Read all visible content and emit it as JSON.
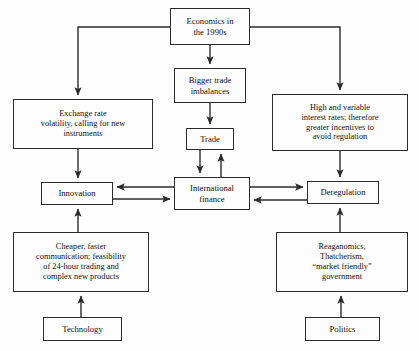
{
  "diagram": {
    "title_node": "economics-in-the-1990s",
    "nodes": [
      {
        "key": "economics",
        "name": "node-economics-in-the-1990s",
        "label": "Economics in\nthe 1990s",
        "x": 170,
        "y": 8,
        "w": 80,
        "h": 37
      },
      {
        "key": "bigger_trade",
        "name": "node-bigger-trade-imbalances",
        "label": "Bigger trade\nimbalances",
        "x": 174,
        "y": 68,
        "w": 72,
        "h": 35
      },
      {
        "key": "trade",
        "name": "node-trade",
        "label": "Trade",
        "x": 186,
        "y": 128,
        "w": 48,
        "h": 22
      },
      {
        "key": "exchange_rate",
        "name": "node-exchange-rate-volatility",
        "label": "Exchange rate\nvolatility, calling for new\ninstruments",
        "x": 13,
        "y": 99,
        "w": 140,
        "h": 50
      },
      {
        "key": "high_rates",
        "name": "node-high-and-variable-interest-rates",
        "label": "High and variable\ninterest rates; therefore\ngreater incentives to\navoid regulation",
        "x": 272,
        "y": 94,
        "w": 136,
        "h": 57
      },
      {
        "key": "innovation",
        "name": "node-innovation",
        "label": "Innovation",
        "x": 41,
        "y": 182,
        "w": 72,
        "h": 23
      },
      {
        "key": "intl_finance",
        "name": "node-international-finance",
        "label": "International\nfinance",
        "x": 174,
        "y": 177,
        "w": 76,
        "h": 33
      },
      {
        "key": "deregulation",
        "name": "node-deregulation",
        "label": "Deregulation",
        "x": 307,
        "y": 181,
        "w": 72,
        "h": 23
      },
      {
        "key": "cheaper_faster",
        "name": "node-cheaper-faster-communication",
        "label": "Cheaper, faster\ncommunication; feasibility\nof 24-hour trading and\ncomplex new products",
        "x": 13,
        "y": 232,
        "w": 136,
        "h": 60
      },
      {
        "key": "reaganomics",
        "name": "node-reaganomics-thatcherism",
        "label": "Reaganomics,\nThatcherism,\n“market friendly”\ngovernment",
        "x": 276,
        "y": 232,
        "w": 132,
        "h": 60
      },
      {
        "key": "technology",
        "name": "node-technology",
        "label": "Technology",
        "x": 43,
        "y": 317,
        "w": 79,
        "h": 24
      },
      {
        "key": "politics",
        "name": "node-politics",
        "label": "Politics",
        "x": 305,
        "y": 317,
        "w": 75,
        "h": 24
      }
    ],
    "edges": [
      {
        "name": "edge-economics-to-exchange-rate",
        "from": "economics",
        "to": "exchange_rate",
        "kind": "elbow-left",
        "points": "210,27 78,27 78,95",
        "arrow_end": true
      },
      {
        "name": "edge-economics-to-high-rates",
        "from": "economics",
        "to": "high_rates",
        "kind": "elbow-right",
        "points": "210,27 340,27 340,90",
        "arrow_end": true
      },
      {
        "name": "edge-economics-to-bigger-trade",
        "from": "economics",
        "to": "bigger_trade",
        "kind": "straight-down",
        "points": "210,45 210,64",
        "arrow_end": true
      },
      {
        "name": "edge-bigger-trade-to-trade",
        "from": "bigger_trade",
        "to": "trade",
        "kind": "straight-down",
        "points": "210,103 210,124",
        "arrow_end": true
      },
      {
        "name": "edge-trade-to-international-finance",
        "from": "trade",
        "to": "intl_finance",
        "kind": "straight-down",
        "points": "200,150 200,173",
        "arrow_end": true
      },
      {
        "name": "edge-international-finance-to-trade",
        "from": "intl_finance",
        "to": "trade",
        "kind": "straight-up",
        "points": "221,177 221,154",
        "arrow_end": true
      },
      {
        "name": "edge-exchange-rate-to-innovation",
        "from": "exchange_rate",
        "to": "innovation",
        "kind": "straight-down",
        "points": "78,149 78,178",
        "arrow_end": true
      },
      {
        "name": "edge-high-rates-to-deregulation",
        "from": "high_rates",
        "to": "deregulation",
        "kind": "straight-down",
        "points": "340,151 340,177",
        "arrow_end": true
      },
      {
        "name": "edge-international-finance-to-innovation",
        "from": "intl_finance",
        "to": "innovation",
        "kind": "straight-left",
        "points": "174,187 117,187",
        "arrow_end": true
      },
      {
        "name": "edge-innovation-to-international-finance",
        "from": "innovation",
        "to": "intl_finance",
        "kind": "straight-right",
        "points": "113,199 170,199",
        "arrow_end": true
      },
      {
        "name": "edge-international-finance-to-deregulation",
        "from": "intl_finance",
        "to": "deregulation",
        "kind": "straight-right",
        "points": "250,187 303,187",
        "arrow_end": true
      },
      {
        "name": "edge-deregulation-to-international-finance",
        "from": "deregulation",
        "to": "intl_finance",
        "kind": "straight-left",
        "points": "307,200 254,200",
        "arrow_end": true
      },
      {
        "name": "edge-cheaper-faster-to-innovation",
        "from": "cheaper_faster",
        "to": "innovation",
        "kind": "straight-up",
        "points": "78,232 78,209",
        "arrow_end": true
      },
      {
        "name": "edge-reaganomics-to-deregulation",
        "from": "reaganomics",
        "to": "deregulation",
        "kind": "straight-up",
        "points": "340,232 340,208",
        "arrow_end": true
      },
      {
        "name": "edge-technology-to-cheaper-faster",
        "from": "technology",
        "to": "cheaper_faster",
        "kind": "straight-up",
        "points": "81,317 81,296",
        "arrow_end": true
      },
      {
        "name": "edge-politics-to-reaganomics",
        "from": "politics",
        "to": "reaganomics",
        "kind": "straight-up",
        "points": "341,317 341,296",
        "arrow_end": true
      }
    ],
    "colors": {
      "stroke": "#2b2b2b",
      "node_fill": "#fdfdfd",
      "text": "#111111",
      "background": "#fefefe"
    }
  }
}
